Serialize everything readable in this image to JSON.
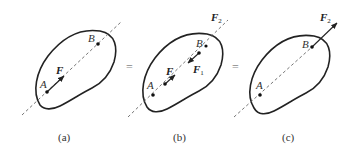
{
  "figure": {
    "separator": "=",
    "panels": [
      {
        "caption": "(a)",
        "points": {
          "A": "A",
          "B": "B"
        },
        "forces": [
          {
            "name": "F",
            "subscript": ""
          }
        ]
      },
      {
        "caption": "(b)",
        "points": {
          "A": "A",
          "B": "B"
        },
        "forces": [
          {
            "name": "F",
            "subscript": ""
          },
          {
            "name": "F",
            "subscript": "1"
          },
          {
            "name": "F",
            "subscript": "2"
          }
        ]
      },
      {
        "caption": "(c)",
        "points": {
          "A": "A",
          "B": "B"
        },
        "forces": [
          {
            "name": "F",
            "subscript": "2"
          }
        ]
      }
    ]
  },
  "colors": {
    "outline": "#222222",
    "line_of_action": "#666666",
    "background": "#ffffff"
  }
}
